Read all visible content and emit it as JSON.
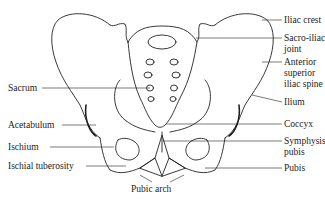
{
  "diagram": {
    "labels": {
      "iliac_crest": "Iliac crest",
      "sacro_iliac_joint_1": "Sacro-iliac",
      "sacro_iliac_joint_2": "joint",
      "asis_1": "Anterior",
      "asis_2": "superior",
      "asis_3": "iliac spine",
      "ilium": "Ilium",
      "coccyx": "Coccyx",
      "symphysis_1": "Symphysis",
      "symphysis_2": "pubis",
      "pubis": "Pubis",
      "sacrum": "Sacrum",
      "acetabulum": "Acetabulum",
      "ischium": "Ischium",
      "ischial_tuberosity": "Ischial tuberosity",
      "pubic_arch": "Pubic arch"
    },
    "colors": {
      "line": "#222222",
      "background": "#ffffff"
    }
  }
}
